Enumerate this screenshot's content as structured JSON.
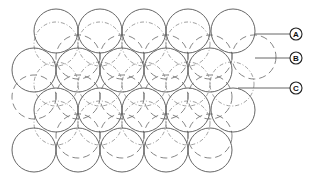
{
  "diagram": {
    "radius": 22,
    "layers": {
      "A": {
        "style": "solid",
        "rows": [
          {
            "y": 31,
            "x": [
              56,
              100,
              144,
              188,
              233
            ]
          },
          {
            "y": 70,
            "x": [
              34,
              78,
              122,
              166,
              210
            ]
          },
          {
            "y": 110,
            "x": [
              56,
              100,
              144,
              188,
              233
            ]
          },
          {
            "y": 150,
            "x": [
              34,
              78,
              122,
              166,
              210
            ]
          }
        ]
      },
      "B": {
        "style": "long-dash",
        "rows": [
          {
            "y": 57,
            "x": [
              78,
              122,
              166,
              210,
              254
            ]
          },
          {
            "y": 97,
            "x": [
              34,
              78,
              122,
              166,
              210
            ]
          },
          {
            "y": 136,
            "x": [
              78,
              122,
              166,
              210
            ]
          }
        ]
      },
      "C": {
        "style": "dash-dot",
        "rows": [
          {
            "y": 44,
            "x": [
              56,
              100,
              144,
              188
            ]
          },
          {
            "y": 84,
            "x": [
              56,
              100,
              144,
              188,
              232
            ]
          },
          {
            "y": 123,
            "x": [
              56,
              100,
              144,
              188
            ]
          }
        ]
      }
    },
    "labels": [
      {
        "id": "A",
        "text": "A",
        "line_y": 34,
        "line_x1": 255,
        "line_x2": 290,
        "cx": 296,
        "cy": 34
      },
      {
        "id": "B",
        "text": "B",
        "line_y": 58,
        "line_x1": 255,
        "line_x2": 290,
        "cx": 296,
        "cy": 58
      },
      {
        "id": "C",
        "text": "C",
        "line_y": 88,
        "line_x1": 238,
        "line_x2": 290,
        "cx": 296,
        "cy": 88
      }
    ]
  }
}
